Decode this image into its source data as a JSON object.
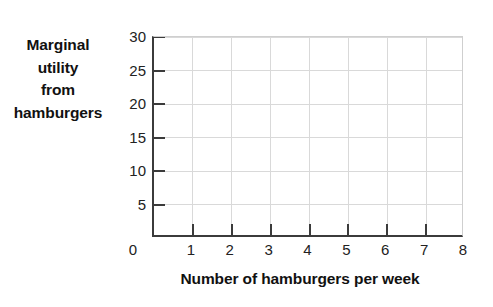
{
  "chart_data": {
    "type": "line",
    "title": "",
    "subtitle": "",
    "xlabel": "Number of hamburgers per week",
    "ylabel": "Marginal utility from hamburgers",
    "ylabel_lines": [
      "Marginal",
      "utility",
      "from",
      "hamburgers"
    ],
    "x": [
      0,
      1,
      2,
      3,
      4,
      5,
      6,
      7,
      8
    ],
    "xtick_labels": [
      "0",
      "1",
      "2",
      "3",
      "4",
      "5",
      "6",
      "7",
      "8"
    ],
    "y": [
      0,
      5,
      10,
      15,
      20,
      25,
      30
    ],
    "ytick_labels": [
      "5",
      "10",
      "15",
      "20",
      "25",
      "30"
    ],
    "ytick_values": [
      5,
      10,
      15,
      20,
      25,
      30
    ],
    "origin_label": "0",
    "xlim": [
      0,
      8
    ],
    "ylim": [
      0,
      30
    ],
    "series": [],
    "values": [],
    "categories": [],
    "grid": true,
    "grid_color": "#d9d9d9",
    "axis_color": "#3b3b3b",
    "background_color": "#ffffff",
    "text_color": "#111111",
    "legend": [],
    "legend_position": "none",
    "annotations": []
  }
}
